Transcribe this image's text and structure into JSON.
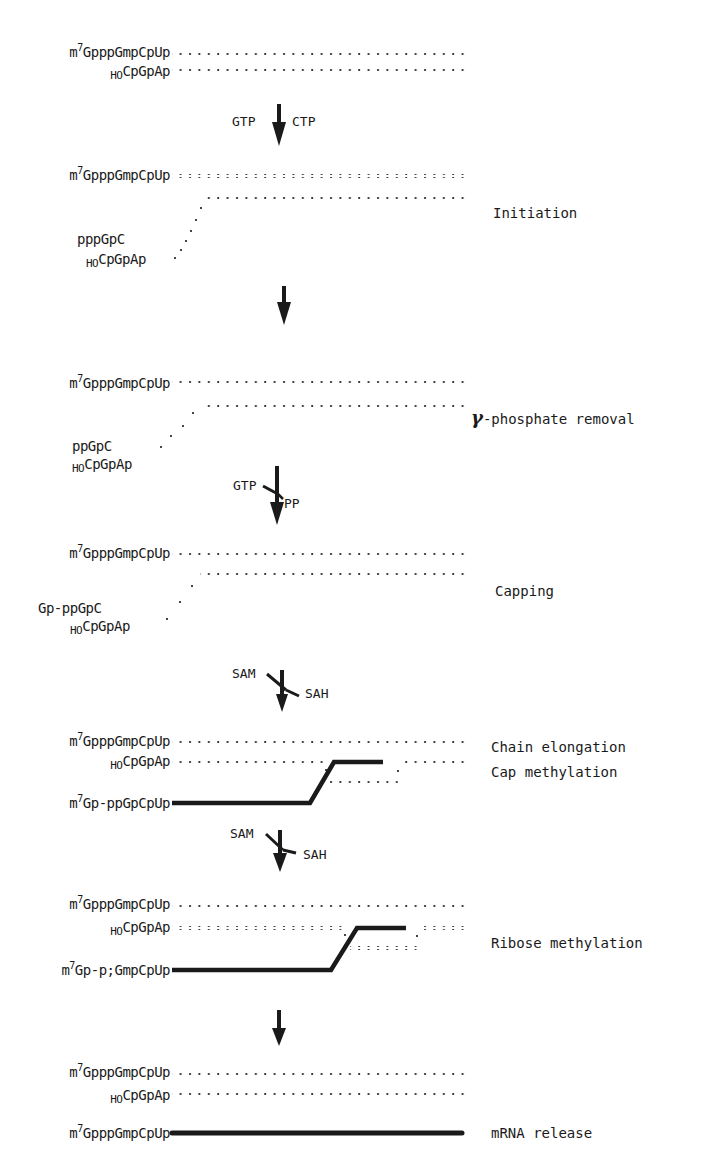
{
  "domain": "Diagram",
  "diagram": {
    "type": "mRNA transcription and capping scheme",
    "colors": {
      "ink": "#1a1a1a",
      "background": "#ffffff"
    },
    "stages": [
      {
        "name": "start",
        "template_strand": {
          "sup": "7",
          "prefix": "m",
          "text": "GpppGmpCpUp"
        },
        "primer": {
          "sub": "HO",
          "text": "CpGpAp"
        }
      },
      {
        "name": "initiation",
        "reagents": {
          "left": "GTP",
          "right": "CTP"
        },
        "template_strand": {
          "sup": "7",
          "prefix": "m",
          "text": "GpppGmpCpUp"
        },
        "nascent": "pppGpC",
        "primer": {
          "sub": "HO",
          "text": "CpGpAp"
        },
        "label": "Initiation"
      },
      {
        "name": "gamma-phosphate-removal",
        "template_strand": {
          "sup": "7",
          "prefix": "m",
          "text": "GpppGmpCpUp"
        },
        "nascent": "ppGpC",
        "primer": {
          "sub": "HO",
          "text": "CpGpAp"
        },
        "label_symbol": "γ",
        "label": "-phosphate removal"
      },
      {
        "name": "capping",
        "reagents": {
          "left": "GTP",
          "right": "PP"
        },
        "template_strand": {
          "sup": "7",
          "prefix": "m",
          "text": "GpppGmpCpUp"
        },
        "nascent": "Gp-ppGpC",
        "primer": {
          "sub": "HO",
          "text": "CpGpAp"
        },
        "label": "Capping"
      },
      {
        "name": "chain-elongation-cap-methylation",
        "reagents": {
          "left": "SAM",
          "right": "SAH"
        },
        "template_strand": {
          "sup": "7",
          "prefix": "m",
          "text": "GpppGmpCpUp"
        },
        "primer": {
          "sub": "HO",
          "text": "CpGpAp"
        },
        "product": {
          "sup": "7",
          "prefix": "m",
          "text": "Gp-ppGpCpUp"
        },
        "labels": [
          "Chain elongation",
          "Cap methylation"
        ]
      },
      {
        "name": "ribose-methylation",
        "reagents": {
          "left": "SAM",
          "right": "SAH"
        },
        "template_strand": {
          "sup": "7",
          "prefix": "m",
          "text": "GpppGmpCpUp"
        },
        "primer": {
          "sub": "HO",
          "text": "CpGpAp"
        },
        "product": {
          "sup": "7",
          "prefix": "m",
          "text": "Gp-p;GmpCpUp"
        },
        "label": "Ribose methylation"
      },
      {
        "name": "mrna-release",
        "template_strand": {
          "sup": "7",
          "prefix": "m",
          "text": "GpppGmpCpUp"
        },
        "primer": {
          "sub": "HO",
          "text": "CpGpAp"
        },
        "product": {
          "sup": "7",
          "prefix": "m",
          "text": "GpppGmpCpUp"
        },
        "label": "mRNA release"
      }
    ]
  }
}
